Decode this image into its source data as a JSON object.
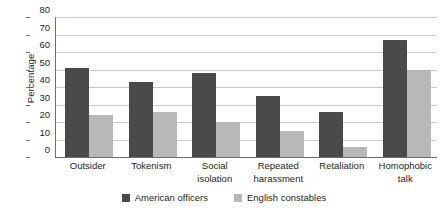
{
  "chart_data": {
    "type": "bar",
    "title": "",
    "xlabel": "",
    "ylabel": "Percentage",
    "ylim": [
      0,
      80
    ],
    "yticks": [
      0,
      10,
      20,
      30,
      40,
      50,
      60,
      70,
      80
    ],
    "ytick_labels": [
      "0",
      "10",
      "20",
      "30",
      "40",
      "50",
      "60",
      "70",
      "80"
    ],
    "grid": true,
    "legend_position": "bottom-center",
    "categories": [
      "Outsider",
      "Tokenism",
      "Social isolation",
      "Repeated harassment",
      "Retaliation",
      "Homophobic talk"
    ],
    "category_lines": [
      [
        "Outsider"
      ],
      [
        "Tokenism"
      ],
      [
        "Social",
        "isolation"
      ],
      [
        "Repeated",
        "harassment"
      ],
      [
        "Retaliation"
      ],
      [
        "Homophobic",
        "talk"
      ]
    ],
    "series": [
      {
        "name": "American officers",
        "color": "#4a4a4a",
        "values": [
          51,
          43,
          48,
          35,
          26,
          67
        ]
      },
      {
        "name": "English constables",
        "color": "#b8b8b8",
        "values": [
          24,
          26,
          20,
          15,
          6,
          50
        ]
      }
    ]
  },
  "colors": {
    "series_a": "#4a4a4a",
    "series_b": "#b8b8b8",
    "gridline": "#c9cacc",
    "axis": "#6d6e70",
    "text": "#231f20",
    "background": "#ffffff"
  }
}
